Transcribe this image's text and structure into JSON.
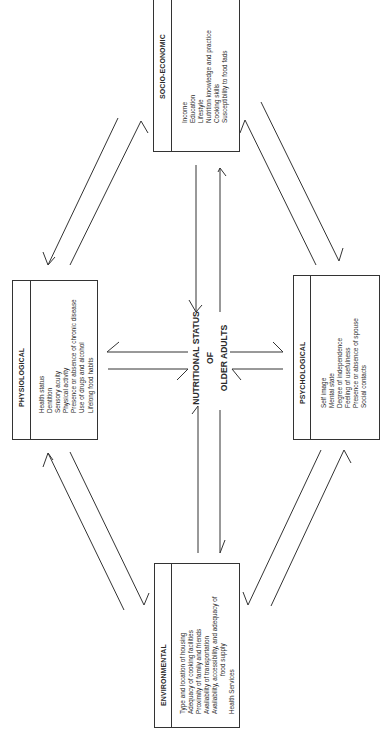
{
  "title": "Nutritional Status of Older Adults",
  "center": {
    "line1": "NUTRITIONAL STATUS",
    "line2": "OF",
    "line3": "OLDER ADULTS"
  },
  "boxes": {
    "socio_economic": {
      "heading": "SOCIO-ECONOMIC",
      "items": [
        "Income",
        "Education",
        "Lifestyle",
        "Nutrition knowledge and practice",
        "Cooking skills",
        "Susceptibility to food fads"
      ]
    },
    "physiological": {
      "heading": "PHYSIOLOGICAL",
      "items": [
        "Health status",
        "Dentition",
        "Sensory acuity",
        "Physical activity",
        "Presence or absence of chronic disease",
        "Use of drugs and alcohol",
        "Lifelong food habits"
      ]
    },
    "psychological": {
      "heading": "PSYCHOLOGICAL",
      "items": [
        "Self image",
        "Mental state",
        "Degree of independence",
        "Feeling of usefulness",
        "Presence or absence of spouse",
        "Social contacts"
      ]
    },
    "environmental": {
      "heading": "ENVIRONMENTAL",
      "items": [
        "Type and location of housing",
        "Adequacy of cooking facilities",
        "Proximity of family and friends",
        "Availability of transportation",
        "Availability, accessibility, and adequacy of",
        "food supply",
        "Health Services"
      ]
    }
  },
  "colors": {
    "line": "#333333",
    "background": "#ffffff",
    "text": "#2a2a2a"
  }
}
